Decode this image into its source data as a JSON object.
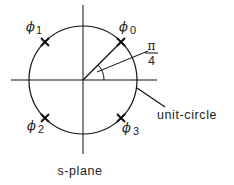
{
  "diagram": {
    "caption": "s-plane",
    "circle_label": "unit-circle",
    "angle_label": {
      "numerator": "π",
      "denominator": "4"
    },
    "poles": [
      {
        "symbol": "ϕ",
        "subscript": "0"
      },
      {
        "symbol": "ϕ",
        "subscript": "1"
      },
      {
        "symbol": "ϕ",
        "subscript": "2"
      },
      {
        "symbol": "ϕ",
        "subscript": "3"
      }
    ],
    "marker": "X",
    "colors": {
      "stroke": "#111111",
      "background": "#ffffff"
    }
  }
}
